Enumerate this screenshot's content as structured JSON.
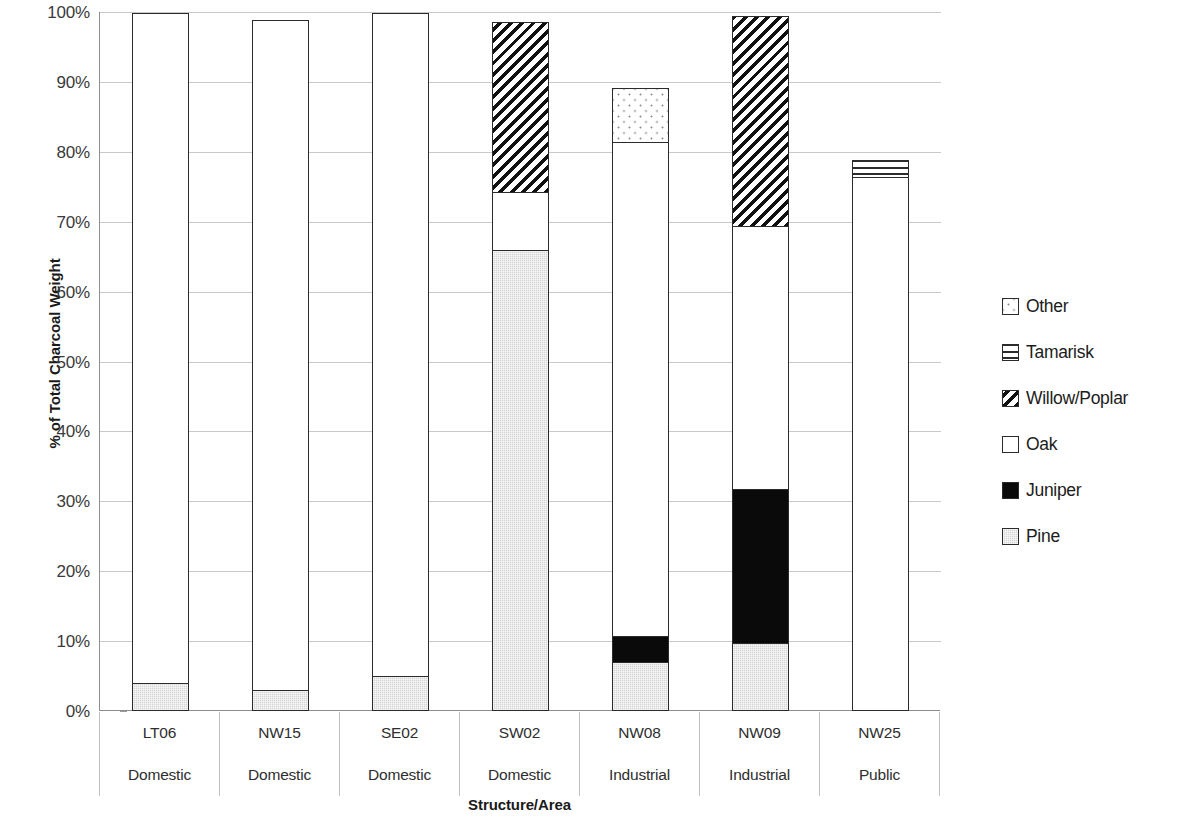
{
  "chart_data": {
    "type": "bar",
    "subtype": "stacked-vertical-100pct",
    "title": "",
    "xlabel": "Structure/Area",
    "ylabel": "% of Total Charcoal Weight",
    "ylim": [
      0,
      100
    ],
    "ytick_labels": [
      "100%",
      "90%",
      "80%",
      "70%",
      "60%",
      "50%",
      "40%",
      "30%",
      "20%",
      "10%",
      "0%"
    ],
    "ytick_values": [
      100,
      90,
      80,
      70,
      60,
      50,
      40,
      30,
      20,
      10,
      0
    ],
    "grid": true,
    "legend_position": "right",
    "categories": [
      "LT06",
      "NW15",
      "SE02",
      "SW02",
      "NW08",
      "NW09",
      "NW25"
    ],
    "category_groups": [
      "Domestic",
      "Domestic",
      "Domestic",
      "Domestic",
      "Industrial",
      "Industrial",
      "Public"
    ],
    "stack_order_bottom_to_top": [
      "Pine",
      "Juniper",
      "Oak",
      "Willow/Poplar",
      "Tamarisk",
      "Other"
    ],
    "series": [
      {
        "name": "Pine",
        "pattern": "light-gray-fill",
        "values": [
          4,
          3,
          5,
          66,
          7,
          9.8,
          0
        ]
      },
      {
        "name": "Juniper",
        "pattern": "solid-black",
        "values": [
          0,
          0,
          0,
          0,
          4,
          22.2,
          0
        ]
      },
      {
        "name": "Oak",
        "pattern": "white-empty",
        "values": [
          96,
          96,
          95,
          8.5,
          70.8,
          37.8,
          76.5
        ]
      },
      {
        "name": "Willow/Poplar",
        "pattern": "diagonal-hatch",
        "values": [
          0,
          0,
          0,
          24.5,
          0,
          30.2,
          0
        ]
      },
      {
        "name": "Tamarisk",
        "pattern": "horizontal-lines",
        "values": [
          0,
          0,
          0,
          0,
          0,
          0,
          2.5
        ]
      },
      {
        "name": "Other",
        "pattern": "dotted",
        "values": [
          0,
          0,
          0,
          0,
          8,
          0,
          0
        ]
      }
    ],
    "bar_totals": [
      100,
      99,
      100,
      99,
      89.8,
      100,
      79
    ]
  },
  "legend": {
    "entries": [
      {
        "label": "Other",
        "swatch": "dotted-swatch"
      },
      {
        "label": "Tamarisk",
        "swatch": "horizontal-lines-swatch"
      },
      {
        "label": "Willow/Poplar",
        "swatch": "diagonal-hatch-swatch"
      },
      {
        "label": "Oak",
        "swatch": "white-empty-swatch"
      },
      {
        "label": "Juniper",
        "swatch": "solid-black-swatch"
      },
      {
        "label": "Pine",
        "swatch": "light-gray-swatch"
      }
    ]
  },
  "colors": {
    "pine": "#d4d4d4",
    "juniper": "#0a0a0a",
    "oak": "#ffffff",
    "outline": "#2b2b2b",
    "gridline": "#c9c9c9",
    "axis": "#8d8d8d"
  }
}
